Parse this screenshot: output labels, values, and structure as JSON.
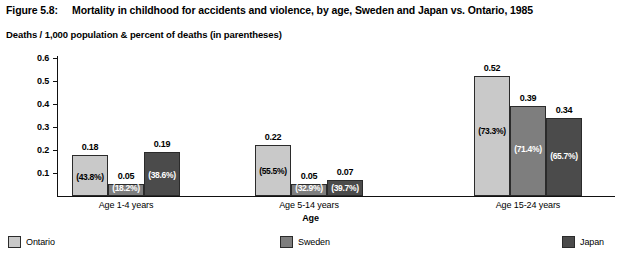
{
  "header": {
    "figure_number": "Figure 5.8:",
    "title": "Mortality in childhood for accidents and violence, by age, Sweden and Japan vs. Ontario, 1985",
    "subtitle": "Deaths / 1,000 population & percent of deaths (in parentheses)"
  },
  "chart_data": {
    "type": "bar",
    "title": "Mortality in childhood for accidents and violence, by age, Sweden and Japan vs. Ontario, 1985",
    "subtitle": "Deaths / 1,000 population & percent of deaths (in parentheses)",
    "xlabel": "Age",
    "ylabel": "",
    "ylim": [
      0,
      0.6
    ],
    "yticks": [
      "0.1",
      "0.2",
      "0.3",
      "0.4",
      "0.5",
      "0.6"
    ],
    "ytick_values": [
      0.1,
      0.2,
      0.3,
      0.4,
      0.5,
      0.6
    ],
    "grid": false,
    "legend_position": "bottom",
    "categories": [
      "Age 1-4 years",
      "Age 5-14 years",
      "Age 15-24 years"
    ],
    "series": [
      {
        "name": "Ontario",
        "color": "#c9c9c9",
        "values": [
          0.18,
          0.22,
          0.52
        ],
        "labels": [
          "0.18",
          "0.22",
          "0.52"
        ],
        "percents": [
          "(43.8%)",
          "(55.5%)",
          "(73.3%)"
        ]
      },
      {
        "name": "Sweden",
        "color": "#7e7e7e",
        "values": [
          0.05,
          0.05,
          0.39
        ],
        "labels": [
          "0.05",
          "0.05",
          "0.39"
        ],
        "percents": [
          "(18.2%)",
          "(32.9%)",
          "(71.4%)"
        ]
      },
      {
        "name": "Japan",
        "color": "#4b4b4b",
        "values": [
          0.19,
          0.07,
          0.34
        ],
        "labels": [
          "0.19",
          "0.07",
          "0.34"
        ],
        "percents": [
          "(38.6%)",
          "(39.7%)",
          "(65.7%)"
        ]
      }
    ]
  },
  "legend": {
    "items": [
      {
        "label": "Ontario",
        "color": "#c9c9c9"
      },
      {
        "label": "Sweden",
        "color": "#7e7e7e"
      },
      {
        "label": "Japan",
        "color": "#4b4b4b"
      }
    ]
  }
}
